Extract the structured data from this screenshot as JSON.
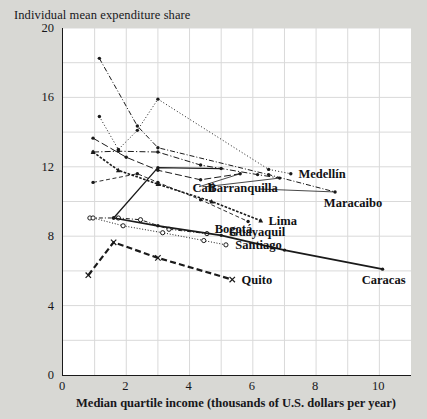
{
  "chart": {
    "title": "Individual mean expenditure share",
    "xlabel": "Median quartile income (thousands of U.S. dollars per year)",
    "ylabel": "Individual mean expenditure share"
  },
  "chart_data": {
    "type": "line",
    "title": "Individual mean expenditure share",
    "xlabel": "Median quartile income (thousands of U.S. dollars per year)",
    "ylabel": "Individual mean expenditure share",
    "xlim": [
      0,
      11
    ],
    "ylim": [
      0,
      20
    ],
    "xticks": [
      0,
      2,
      4,
      6,
      8,
      10
    ],
    "yticks": [
      0,
      4,
      8,
      12,
      16,
      20
    ],
    "grid": true,
    "gridline_step_x": 1,
    "gridline_step_y": 2,
    "legend": "inline-endpoint-labels",
    "series": [
      {
        "name": "Medellín",
        "color": "#1a1a1a",
        "dash": "dotted",
        "marker": "dot",
        "points": [
          [
            1.15,
            14.9
          ],
          [
            1.75,
            13.0
          ],
          [
            2.35,
            14.1
          ],
          [
            3.0,
            15.9
          ],
          [
            6.5,
            11.85
          ],
          [
            7.2,
            11.6
          ]
        ]
      },
      {
        "name": "Barranquilla",
        "color": "#1a1a1a",
        "dash": "dashdot",
        "marker": "dot",
        "points": [
          [
            0.95,
            12.85
          ],
          [
            1.75,
            12.9
          ],
          [
            3.0,
            12.85
          ],
          [
            4.35,
            12.1
          ],
          [
            6.15,
            11.55
          ],
          [
            6.85,
            11.35
          ]
        ]
      },
      {
        "name": "Maracaibo",
        "color": "#1a1a1a",
        "dash": "dashdot-fine",
        "marker": "dot",
        "points": [
          [
            1.15,
            18.25
          ],
          [
            2.35,
            14.35
          ],
          [
            3.0,
            13.1
          ],
          [
            6.5,
            11.55
          ],
          [
            8.6,
            10.55
          ]
        ]
      },
      {
        "name": "Cali",
        "color": "#1a1a1a",
        "dash": "dashed-long",
        "marker": "dot",
        "points": [
          [
            0.95,
            13.65
          ],
          [
            2.0,
            12.55
          ],
          [
            3.0,
            11.8
          ],
          [
            4.35,
            11.25
          ],
          [
            5.6,
            11.6
          ]
        ]
      },
      {
        "name": "Lima",
        "color": "#1a1a1a",
        "dash": "dense-dash",
        "marker": "triangle",
        "points": [
          [
            0.95,
            12.85
          ],
          [
            1.75,
            11.8
          ],
          [
            3.0,
            11.0
          ],
          [
            4.7,
            10.0
          ],
          [
            6.25,
            8.9
          ]
        ]
      },
      {
        "name": "Guayaquil",
        "color": "#1a1a1a",
        "dash": "dashed-fine",
        "marker": "dot",
        "points": [
          [
            0.95,
            11.1
          ],
          [
            2.35,
            11.6
          ],
          [
            3.0,
            11.1
          ],
          [
            4.35,
            10.1
          ],
          [
            5.85,
            8.85
          ]
        ]
      },
      {
        "name": "Bogotá",
        "color": "#1a1a1a",
        "dash": "solid",
        "marker": "dot",
        "points": [
          [
            1.6,
            9.05
          ],
          [
            3.0,
            11.95
          ],
          [
            5.0,
            11.9
          ]
        ]
      },
      {
        "name": "Bogotá-low",
        "color": "#1a1a1a",
        "dash": "dashdot-open",
        "marker": "open-circle",
        "points": [
          [
            0.85,
            9.05
          ],
          [
            1.75,
            9.05
          ],
          [
            2.45,
            8.95
          ],
          [
            3.35,
            8.4
          ],
          [
            4.55,
            8.15
          ]
        ]
      },
      {
        "name": "Santiago",
        "color": "#1a1a1a",
        "dash": "dotted-fine",
        "marker": "open-circle",
        "points": [
          [
            0.95,
            9.05
          ],
          [
            1.9,
            8.6
          ],
          [
            3.15,
            8.2
          ],
          [
            4.45,
            7.75
          ],
          [
            5.15,
            7.5
          ]
        ]
      },
      {
        "name": "Caracas",
        "color": "#1a1a1a",
        "dash": "solid-thick",
        "marker": "dot",
        "points": [
          [
            1.6,
            9.05
          ],
          [
            3.0,
            8.6
          ],
          [
            5.0,
            8.05
          ],
          [
            7.0,
            7.2
          ],
          [
            10.1,
            6.1
          ]
        ]
      },
      {
        "name": "Quito",
        "color": "#1a1a1a",
        "dash": "dashed-heavy",
        "marker": "x",
        "points": [
          [
            0.8,
            5.75
          ],
          [
            1.6,
            7.65
          ],
          [
            3.0,
            6.75
          ],
          [
            5.35,
            5.5
          ]
        ]
      }
    ],
    "annotations": [
      {
        "text": "Medellín",
        "x": 7.35,
        "y": 11.6
      },
      {
        "text": "Barranquilla",
        "x": 4.5,
        "y": 10.75
      },
      {
        "text": "Maracaibo",
        "x": 8.15,
        "y": 9.9
      },
      {
        "text": "Cali",
        "x": 4.0,
        "y": 10.75
      },
      {
        "text": "Lima",
        "x": 6.4,
        "y": 8.9
      },
      {
        "text": "Guayaquil",
        "x": 5.15,
        "y": 8.25
      },
      {
        "text": "Bogotá",
        "x": 4.7,
        "y": 8.4
      },
      {
        "text": "Santiago",
        "x": 5.35,
        "y": 7.5
      },
      {
        "text": "Caracas",
        "x": 9.35,
        "y": 5.5
      },
      {
        "text": "Quito",
        "x": 5.55,
        "y": 5.5
      }
    ]
  },
  "axes": {
    "yticks": [
      "20",
      "16",
      "12",
      "8",
      "4",
      "0"
    ],
    "xticks": [
      "0",
      "2",
      "4",
      "6",
      "8",
      "10"
    ]
  }
}
